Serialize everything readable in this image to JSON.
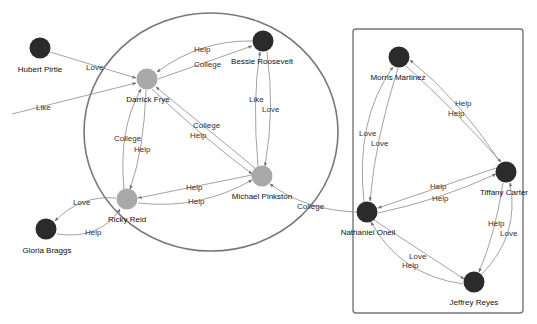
{
  "diagram": {
    "type": "network-graph",
    "colors": {
      "node_dark": "#2b2b2b",
      "node_light": "#a9a9a9",
      "edge": "#8a8a8a",
      "group_outline": "#777777",
      "background": "#ffffff"
    },
    "groups": [
      {
        "id": "circle-group",
        "shape": "ellipse",
        "members": [
          "Darrick Frye",
          "Bessie Roosevelt",
          "Ricky Reid",
          "Michael Pinkston"
        ]
      },
      {
        "id": "box-group",
        "shape": "rectangle",
        "members": [
          "Morris Martinez",
          "Tiffany Carter",
          "Nathaniel Oneil",
          "Jeffrey Reyes"
        ]
      }
    ],
    "nodes": [
      {
        "id": "hubert",
        "label": "Hubert Pirtle",
        "x": 40,
        "y": 48,
        "style": "dark"
      },
      {
        "id": "darrick",
        "label": "Darrick Frye",
        "x": 147,
        "y": 79,
        "style": "light"
      },
      {
        "id": "bessie",
        "label": "Bessie Roosevelt",
        "x": 263,
        "y": 41,
        "style": "dark"
      },
      {
        "id": "ricky",
        "label": "Ricky Reid",
        "x": 127,
        "y": 199,
        "style": "light"
      },
      {
        "id": "michael",
        "label": "Michael Pinkston",
        "x": 262,
        "y": 176,
        "style": "light"
      },
      {
        "id": "gloria",
        "label": "Gloria Braggs",
        "x": 46,
        "y": 229,
        "style": "dark"
      },
      {
        "id": "morris",
        "label": "Morris Martinez",
        "x": 399,
        "y": 57,
        "style": "dark"
      },
      {
        "id": "tiffany",
        "label": "Tiffany Carter",
        "x": 506,
        "y": 172,
        "style": "dark"
      },
      {
        "id": "nathaniel",
        "label": "Nathaniel Oneil",
        "x": 367,
        "y": 212,
        "style": "dark"
      },
      {
        "id": "jeffrey",
        "label": "Jeffrey Reyes",
        "x": 474,
        "y": 282,
        "style": "dark"
      }
    ],
    "edges": [
      {
        "from": "Hubert Pirtle",
        "to": "Darrick Frye",
        "label": "Love"
      },
      {
        "from": "(offscreen)",
        "to": "Darrick Frye",
        "label": "Like"
      },
      {
        "from": "Bessie Roosevelt",
        "to": "Darrick Frye",
        "label": "Help"
      },
      {
        "from": "Darrick Frye",
        "to": "Bessie Roosevelt",
        "label": "College"
      },
      {
        "from": "Michael Pinkston",
        "to": "Darrick Frye",
        "label": "College"
      },
      {
        "from": "Darrick Frye",
        "to": "Michael Pinkston",
        "label": "Help"
      },
      {
        "from": "Ricky Reid",
        "to": "Darrick Frye",
        "label": "College"
      },
      {
        "from": "Darrick Frye",
        "to": "Ricky Reid",
        "label": "Help"
      },
      {
        "from": "Michael Pinkston",
        "to": "Bessie Roosevelt",
        "label": "Like"
      },
      {
        "from": "Bessie Roosevelt",
        "to": "Michael Pinkston",
        "label": "Love"
      },
      {
        "from": "Michael Pinkston",
        "to": "Ricky Reid",
        "label": "Help"
      },
      {
        "from": "Ricky Reid",
        "to": "Michael Pinkston",
        "label": "Help"
      },
      {
        "from": "Ricky Reid",
        "to": "Gloria Braggs",
        "label": "Love"
      },
      {
        "from": "Gloria Braggs",
        "to": "Ricky Reid",
        "label": "Help"
      },
      {
        "from": "Nathaniel Oneil",
        "to": "Michael Pinkston",
        "label": "College"
      },
      {
        "from": "Tiffany Carter",
        "to": "Morris Martinez",
        "label": "Help"
      },
      {
        "from": "Morris Martinez",
        "to": "Tiffany Carter",
        "label": "Help"
      },
      {
        "from": "Nathaniel Oneil",
        "to": "Morris Martinez",
        "label": "Love"
      },
      {
        "from": "Morris Martinez",
        "to": "Nathaniel Oneil",
        "label": "Love"
      },
      {
        "from": "Tiffany Carter",
        "to": "Nathaniel Oneil",
        "label": "Help"
      },
      {
        "from": "Nathaniel Oneil",
        "to": "Tiffany Carter",
        "label": "Help"
      },
      {
        "from": "Tiffany Carter",
        "to": "Jeffrey Reyes",
        "label": "Help"
      },
      {
        "from": "Jeffrey Reyes",
        "to": "Tiffany Carter",
        "label": "Love"
      },
      {
        "from": "Nathaniel Oneil",
        "to": "Jeffrey Reyes",
        "label": "Love"
      },
      {
        "from": "Jeffrey Reyes",
        "to": "Nathaniel Oneil",
        "label": "Help"
      }
    ]
  },
  "labels": {
    "nodes": {
      "hubert": "Hubert Pirtle",
      "darrick": "Darrick Frye",
      "bessie": "Bessie Roosevelt",
      "ricky": "Ricky Reid",
      "michael": "Michael Pinkston",
      "gloria": "Gloria Braggs",
      "morris": "Morris Martinez",
      "tiffany": "Tiffany Carter",
      "nathaniel": "Nathaniel Oneil",
      "jeffrey": "Jeffrey Reyes"
    },
    "edges": {
      "hubert_darrick": "Love",
      "like_darrick": "Like",
      "bessie_darrick": "Help",
      "darrick_bessie": "College",
      "michael_darrick": "College",
      "darrick_michael": "Help",
      "ricky_darrick": "College",
      "darrick_ricky": "Help",
      "michael_bessie": "Like",
      "bessie_michael": "Love",
      "michael_ricky": "Help",
      "ricky_michael": "Help",
      "ricky_gloria": "Love",
      "gloria_ricky": "Help",
      "nathaniel_michael": "College",
      "tiffany_morris": "Help",
      "morris_tiffany": "Help",
      "nathaniel_morris": "Love",
      "morris_nathaniel": "Love",
      "tiffany_nathaniel": "Help",
      "nathaniel_tiffany": "Help",
      "tiffany_jeffrey": "Help",
      "jeffrey_tiffany": "Love",
      "nathaniel_jeffrey": "Love",
      "jeffrey_nathaniel": "Help"
    }
  }
}
